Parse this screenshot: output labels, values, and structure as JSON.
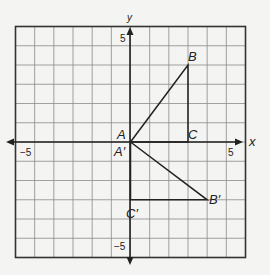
{
  "axes": {
    "x_label": "x",
    "y_label": "y",
    "x_min": -6,
    "x_max": 6,
    "y_min": -6,
    "y_max": 6,
    "tick_labels": {
      "x_neg": "−5",
      "x_pos": "5",
      "y_pos": "5",
      "y_neg": "−5"
    }
  },
  "triangle_original": {
    "points": [
      {
        "name": "A",
        "x": 0,
        "y": 0
      },
      {
        "name": "B",
        "x": 3,
        "y": 4
      },
      {
        "name": "C",
        "x": 3,
        "y": 0
      }
    ],
    "labels": {
      "A": "A",
      "B": "B",
      "C": "C"
    }
  },
  "triangle_image": {
    "points": [
      {
        "name": "A'",
        "x": 0,
        "y": 0
      },
      {
        "name": "B'",
        "x": 4,
        "y": -3
      },
      {
        "name": "C'",
        "x": 0,
        "y": -3
      }
    ],
    "labels": {
      "A": "A′",
      "B": "B′",
      "C": "C′"
    }
  },
  "colors": {
    "grid": "#8a8a8a",
    "border": "#333333",
    "axis": "#222222",
    "figure": "#222222",
    "background": "#f4f4f2"
  }
}
